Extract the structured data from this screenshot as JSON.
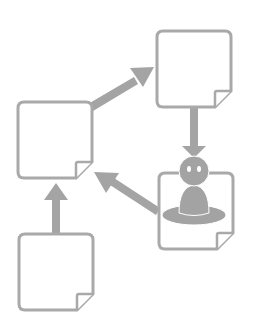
{
  "diagram": {
    "type": "workflow",
    "colors": {
      "stroke": "#a9a9a9",
      "arrow": "#a4a4a4",
      "person": "#a3a3a3",
      "background": "#ffffff"
    },
    "nodes": [
      {
        "id": "doc-left",
        "kind": "document",
        "label": ""
      },
      {
        "id": "doc-top-right",
        "kind": "document",
        "label": ""
      },
      {
        "id": "doc-bottom-left",
        "kind": "document",
        "label": ""
      },
      {
        "id": "doc-person",
        "kind": "document-with-person",
        "label": ""
      }
    ],
    "edges": [
      {
        "from": "doc-bottom-left",
        "to": "doc-left"
      },
      {
        "from": "doc-left",
        "to": "doc-top-right"
      },
      {
        "from": "doc-top-right",
        "to": "doc-person"
      },
      {
        "from": "doc-person",
        "to": "doc-left"
      }
    ]
  }
}
